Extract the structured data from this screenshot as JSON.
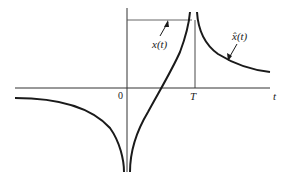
{
  "figure": {
    "type": "function-sketch",
    "axes": {
      "horizontal_label": "t",
      "origin_label": "0",
      "marker_label": "T"
    },
    "curves": [
      {
        "name": "x(t)",
        "label": "x(t)",
        "description": "rises from -∞ at t=0 to +∞ at t=T"
      },
      {
        "name": "x_hat(t)",
        "label": "x̂(t)",
        "description": "negative branch for t<0 tending to -∞ at 0; positive branch for t>T decaying from +∞"
      }
    ],
    "colors": {
      "stroke": "#1a1a1a",
      "axis": "#333333",
      "background": "#ffffff"
    }
  }
}
